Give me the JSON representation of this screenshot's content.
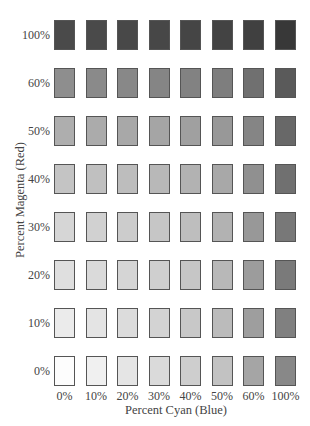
{
  "chart_data": {
    "type": "heatmap",
    "title": "",
    "xlabel": "Percent Cyan (Blue)",
    "ylabel": "Percent Magenta (Red)",
    "x_categories": [
      "0%",
      "10%",
      "20%",
      "30%",
      "40%",
      "50%",
      "60%",
      "100%"
    ],
    "y_categories": [
      "100%",
      "60%",
      "50%",
      "40%",
      "30%",
      "20%",
      "10%",
      "0%"
    ],
    "cell_colors": [
      [
        "#4a4a4a",
        "#4a4a4a",
        "#484848",
        "#474747",
        "#454545",
        "#434343",
        "#404040",
        "#383838"
      ],
      [
        "#8e8e8e",
        "#8a8a8a",
        "#888888",
        "#858585",
        "#828282",
        "#7e7e7e",
        "#707070",
        "#5a5a5a"
      ],
      [
        "#aeaeae",
        "#ababab",
        "#a8a8a8",
        "#a5a5a5",
        "#a0a0a0",
        "#989898",
        "#858585",
        "#686868"
      ],
      [
        "#c4c4c4",
        "#c0c0c0",
        "#bdbdbd",
        "#b8b8b8",
        "#b2b2b2",
        "#a8a8a8",
        "#909090",
        "#707070"
      ],
      [
        "#d6d6d6",
        "#d1d1d1",
        "#cccccc",
        "#c6c6c6",
        "#bebebe",
        "#b2b2b2",
        "#989898",
        "#787878"
      ],
      [
        "#dfdfdf",
        "#dadada",
        "#d5d5d5",
        "#cfcfcf",
        "#c6c6c6",
        "#b8b8b8",
        "#9c9c9c",
        "#7a7a7a"
      ],
      [
        "#ebebeb",
        "#e4e4e4",
        "#dcdcdc",
        "#d3d3d3",
        "#c8c8c8",
        "#bbbbbb",
        "#9e9e9e",
        "#808080"
      ],
      [
        "#fdfdfd",
        "#f0f0f0",
        "#e5e5e5",
        "#dadada",
        "#cecece",
        "#c2c2c2",
        "#a5a5a5",
        "#888888"
      ]
    ],
    "legend": "none",
    "grid": false
  },
  "layout": {
    "col_lefts": [
      54,
      85.5,
      117,
      148.5,
      180,
      211.5,
      243,
      275
    ],
    "row_tops": [
      20,
      68,
      116,
      164,
      212,
      260,
      308,
      356
    ]
  }
}
